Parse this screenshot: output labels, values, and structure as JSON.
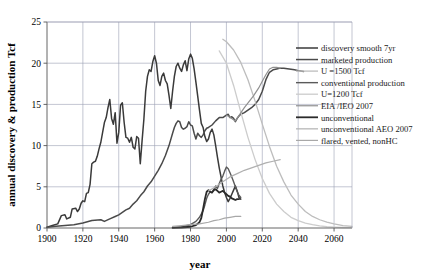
{
  "chart_data": {
    "type": "line",
    "title": "",
    "xlabel": "year",
    "ylabel": "annual discovery & production Tcf",
    "xlim": [
      1900,
      2070
    ],
    "ylim": [
      0,
      25
    ],
    "xticks": [
      1900,
      1920,
      1940,
      1960,
      1980,
      2000,
      2020,
      2040,
      2060
    ],
    "yticks": [
      0,
      5,
      10,
      15,
      20,
      25
    ],
    "grid": true,
    "legend_position": "right",
    "series": [
      {
        "name": "discovery smooth 7yr",
        "color": "#3a3a3a",
        "width": 1.5,
        "points": [
          [
            1900,
            0.1
          ],
          [
            1903,
            0.3
          ],
          [
            1906,
            0.5
          ],
          [
            1908,
            1.5
          ],
          [
            1910,
            1.6
          ],
          [
            1911,
            1.1
          ],
          [
            1913,
            1.3
          ],
          [
            1914,
            2.3
          ],
          [
            1916,
            2.4
          ],
          [
            1917,
            2.0
          ],
          [
            1918,
            2.3
          ],
          [
            1919,
            3.0
          ],
          [
            1920,
            3.3
          ],
          [
            1921,
            3.2
          ],
          [
            1922,
            4.2
          ],
          [
            1923,
            4.3
          ],
          [
            1924,
            5.3
          ],
          [
            1925,
            7.8
          ],
          [
            1926,
            8.0
          ],
          [
            1927,
            8.1
          ],
          [
            1928,
            8.7
          ],
          [
            1929,
            9.6
          ],
          [
            1930,
            10.4
          ],
          [
            1931,
            11.6
          ],
          [
            1932,
            12.8
          ],
          [
            1933,
            13.4
          ],
          [
            1934,
            14.6
          ],
          [
            1935,
            15.6
          ],
          [
            1936,
            13.3
          ],
          [
            1937,
            12.6
          ],
          [
            1938,
            14.0
          ],
          [
            1939,
            10.3
          ],
          [
            1940,
            11.6
          ],
          [
            1941,
            14.9
          ],
          [
            1942,
            15.2
          ],
          [
            1943,
            12.8
          ],
          [
            1944,
            11.0
          ],
          [
            1945,
            10.9
          ],
          [
            1946,
            10.4
          ],
          [
            1947,
            11.0
          ],
          [
            1948,
            9.8
          ],
          [
            1949,
            9.6
          ],
          [
            1950,
            11.1
          ],
          [
            1951,
            10.9
          ],
          [
            1952,
            7.8
          ],
          [
            1953,
            10.6
          ],
          [
            1954,
            13.2
          ],
          [
            1955,
            16.6
          ],
          [
            1956,
            18.4
          ],
          [
            1957,
            19.2
          ],
          [
            1958,
            19.0
          ],
          [
            1959,
            20.2
          ],
          [
            1960,
            20.9
          ],
          [
            1961,
            20.0
          ],
          [
            1962,
            17.9
          ],
          [
            1963,
            17.3
          ],
          [
            1964,
            18.4
          ],
          [
            1965,
            18.8
          ],
          [
            1966,
            17.9
          ],
          [
            1967,
            17.5
          ],
          [
            1968,
            16.1
          ],
          [
            1969,
            14.5
          ],
          [
            1970,
            16.6
          ],
          [
            1971,
            18.4
          ],
          [
            1972,
            19.6
          ],
          [
            1973,
            20.0
          ],
          [
            1974,
            19.4
          ],
          [
            1975,
            19.0
          ],
          [
            1976,
            19.8
          ],
          [
            1977,
            20.3
          ],
          [
            1978,
            19.1
          ],
          [
            1979,
            20.5
          ],
          [
            1980,
            21.1
          ],
          [
            1981,
            20.6
          ],
          [
            1982,
            19.3
          ],
          [
            1983,
            17.7
          ],
          [
            1984,
            16.0
          ],
          [
            1985,
            14.3
          ],
          [
            1986,
            12.7
          ],
          [
            1987,
            12.2
          ],
          [
            1988,
            11.1
          ],
          [
            1989,
            10.5
          ],
          [
            1990,
            10.8
          ],
          [
            1991,
            11.6
          ],
          [
            1992,
            12.0
          ],
          [
            1993,
            11.3
          ],
          [
            1994,
            10.0
          ],
          [
            1995,
            8.6
          ],
          [
            1996,
            7.3
          ],
          [
            1997,
            6.2
          ],
          [
            1998,
            5.1
          ],
          [
            1999,
            4.3
          ],
          [
            2000,
            3.7
          ],
          [
            2001,
            3.2
          ],
          [
            2002,
            3.6
          ],
          [
            2003,
            4.1
          ],
          [
            2004,
            4.6
          ],
          [
            2005,
            5.1
          ],
          [
            2006,
            4.5
          ],
          [
            2007,
            3.7
          ],
          [
            2008,
            3.5
          ]
        ]
      },
      {
        "name": "marketed production",
        "color": "#4a4a4a",
        "width": 1.5,
        "points": [
          [
            1900,
            0.1
          ],
          [
            1905,
            0.2
          ],
          [
            1910,
            0.3
          ],
          [
            1915,
            0.4
          ],
          [
            1920,
            0.6
          ],
          [
            1925,
            0.9
          ],
          [
            1930,
            1.0
          ],
          [
            1932,
            0.8
          ],
          [
            1935,
            1.1
          ],
          [
            1938,
            1.4
          ],
          [
            1940,
            1.6
          ],
          [
            1942,
            1.9
          ],
          [
            1944,
            2.2
          ],
          [
            1946,
            2.4
          ],
          [
            1948,
            2.9
          ],
          [
            1950,
            3.3
          ],
          [
            1952,
            3.9
          ],
          [
            1954,
            4.4
          ],
          [
            1956,
            5.1
          ],
          [
            1958,
            5.6
          ],
          [
            1960,
            6.3
          ],
          [
            1962,
            7.0
          ],
          [
            1964,
            7.8
          ],
          [
            1966,
            8.8
          ],
          [
            1968,
            10.0
          ],
          [
            1970,
            11.5
          ],
          [
            1971,
            12.2
          ],
          [
            1972,
            12.7
          ],
          [
            1973,
            13.0
          ],
          [
            1974,
            12.9
          ],
          [
            1975,
            12.2
          ],
          [
            1976,
            12.0
          ],
          [
            1977,
            12.1
          ],
          [
            1978,
            12.3
          ],
          [
            1979,
            12.9
          ],
          [
            1980,
            12.5
          ],
          [
            1981,
            12.4
          ],
          [
            1982,
            11.5
          ],
          [
            1983,
            10.8
          ],
          [
            1984,
            11.5
          ],
          [
            1985,
            11.2
          ],
          [
            1986,
            11.0
          ],
          [
            1987,
            11.3
          ],
          [
            1988,
            11.8
          ],
          [
            1989,
            12.1
          ],
          [
            1990,
            12.2
          ],
          [
            1992,
            12.5
          ],
          [
            1994,
            13.0
          ],
          [
            1996,
            13.4
          ],
          [
            1998,
            13.4
          ],
          [
            2000,
            13.7
          ],
          [
            2001,
            13.8
          ],
          [
            2002,
            13.4
          ],
          [
            2003,
            13.5
          ],
          [
            2004,
            13.3
          ],
          [
            2005,
            12.9
          ],
          [
            2006,
            13.3
          ],
          [
            2007,
            13.6
          ],
          [
            2008,
            13.8
          ],
          [
            2010,
            14.0
          ],
          [
            2012,
            14.3
          ],
          [
            2014,
            14.6
          ],
          [
            2016,
            15.0
          ],
          [
            2018,
            15.6
          ],
          [
            2020,
            16.6
          ],
          [
            2022,
            18.0
          ],
          [
            2024,
            18.9
          ],
          [
            2026,
            19.2
          ],
          [
            2028,
            19.3
          ],
          [
            2030,
            19.4
          ],
          [
            2032,
            19.4
          ],
          [
            2035,
            19.3
          ],
          [
            2038,
            19.2
          ],
          [
            2040,
            19.1
          ],
          [
            2043,
            19.0
          ]
        ]
      },
      {
        "name": "U =1500 Tcf",
        "color": "#bdbdbd",
        "width": 1.3,
        "points": [
          [
            1998,
            22.9
          ],
          [
            2000,
            22.6
          ],
          [
            2004,
            21.6
          ],
          [
            2008,
            20.1
          ],
          [
            2012,
            18.0
          ],
          [
            2016,
            15.4
          ],
          [
            2020,
            12.6
          ],
          [
            2024,
            9.9
          ],
          [
            2028,
            7.5
          ],
          [
            2032,
            5.6
          ],
          [
            2036,
            4.0
          ],
          [
            2040,
            2.9
          ],
          [
            2044,
            2.0
          ],
          [
            2048,
            1.4
          ],
          [
            2052,
            1.0
          ],
          [
            2056,
            0.7
          ],
          [
            2060,
            0.5
          ],
          [
            2065,
            0.3
          ],
          [
            2070,
            0.2
          ]
        ]
      },
      {
        "name": "conventional production",
        "color": "#5a5a5a",
        "width": 1.4,
        "points": [
          [
            1970,
            0.05
          ],
          [
            1975,
            0.15
          ],
          [
            1980,
            0.4
          ],
          [
            1983,
            0.8
          ],
          [
            1985,
            1.3
          ],
          [
            1987,
            2.1
          ],
          [
            1988,
            2.8
          ],
          [
            1989,
            3.6
          ],
          [
            1990,
            4.1
          ],
          [
            1991,
            4.4
          ],
          [
            1992,
            4.3
          ],
          [
            1993,
            4.7
          ],
          [
            1994,
            5.1
          ],
          [
            1995,
            4.8
          ],
          [
            1996,
            5.4
          ],
          [
            1997,
            5.9
          ],
          [
            1998,
            6.3
          ],
          [
            1999,
            6.9
          ],
          [
            2000,
            7.4
          ],
          [
            2001,
            7.2
          ],
          [
            2002,
            6.7
          ],
          [
            2003,
            6.2
          ],
          [
            2004,
            5.6
          ],
          [
            2005,
            5.0
          ],
          [
            2006,
            4.4
          ],
          [
            2007,
            4.0
          ],
          [
            2008,
            3.7
          ]
        ]
      },
      {
        "name": "U=1200 Tcf",
        "color": "#cccccc",
        "width": 1.3,
        "points": [
          [
            1996,
            21.5
          ],
          [
            2000,
            20.0
          ],
          [
            2004,
            17.3
          ],
          [
            2008,
            14.1
          ],
          [
            2012,
            11.0
          ],
          [
            2016,
            8.3
          ],
          [
            2020,
            6.0
          ],
          [
            2024,
            4.2
          ],
          [
            2028,
            2.9
          ],
          [
            2032,
            2.0
          ],
          [
            2036,
            1.3
          ],
          [
            2040,
            0.9
          ],
          [
            2044,
            0.6
          ],
          [
            2048,
            0.4
          ],
          [
            2052,
            0.25
          ],
          [
            2056,
            0.15
          ],
          [
            2060,
            0.1
          ],
          [
            2065,
            0.06
          ],
          [
            2070,
            0.04
          ]
        ]
      },
      {
        "name": "EIA /IEO 2007",
        "color": "#909090",
        "width": 1.2,
        "points": [
          [
            2000,
            13.7
          ],
          [
            2005,
            13.0
          ],
          [
            2010,
            14.6
          ],
          [
            2015,
            16.0
          ],
          [
            2018,
            17.0
          ],
          [
            2020,
            17.8
          ],
          [
            2022,
            18.6
          ],
          [
            2024,
            19.3
          ],
          [
            2026,
            19.5
          ],
          [
            2028,
            19.5
          ],
          [
            2030,
            19.4
          ]
        ]
      },
      {
        "name": "unconventional",
        "color": "#2b2b2b",
        "width": 1.8,
        "points": [
          [
            1970,
            0.02
          ],
          [
            1975,
            0.06
          ],
          [
            1980,
            0.15
          ],
          [
            1983,
            0.35
          ],
          [
            1985,
            0.7
          ],
          [
            1986,
            1.2
          ],
          [
            1987,
            2.3
          ],
          [
            1988,
            3.5
          ],
          [
            1989,
            4.4
          ],
          [
            1990,
            4.6
          ],
          [
            1991,
            4.4
          ],
          [
            1992,
            4.3
          ],
          [
            1993,
            4.6
          ],
          [
            1994,
            4.7
          ],
          [
            1995,
            4.5
          ],
          [
            1996,
            4.3
          ],
          [
            1997,
            4.4
          ],
          [
            1998,
            4.5
          ],
          [
            1999,
            4.3
          ],
          [
            2000,
            4.1
          ],
          [
            2001,
            3.9
          ],
          [
            2002,
            3.8
          ],
          [
            2003,
            3.6
          ],
          [
            2004,
            3.5
          ],
          [
            2005,
            3.4
          ],
          [
            2006,
            3.5
          ],
          [
            2007,
            3.5
          ]
        ]
      },
      {
        "name": "unconventional AEO 2007",
        "color": "#b0b0b0",
        "width": 1.2,
        "points": [
          [
            1990,
            4.5
          ],
          [
            1994,
            5.0
          ],
          [
            1998,
            5.6
          ],
          [
            2002,
            6.2
          ],
          [
            2006,
            6.6
          ],
          [
            2010,
            7.0
          ],
          [
            2014,
            7.3
          ],
          [
            2018,
            7.6
          ],
          [
            2022,
            7.9
          ],
          [
            2026,
            8.1
          ],
          [
            2030,
            8.3
          ]
        ]
      },
      {
        "name": "flared, vented,  nonHC",
        "color": "#a8a8a8",
        "width": 1.2,
        "points": [
          [
            1970,
            0.2
          ],
          [
            1975,
            0.3
          ],
          [
            1980,
            0.4
          ],
          [
            1985,
            0.5
          ],
          [
            1990,
            0.7
          ],
          [
            1993,
            0.9
          ],
          [
            1996,
            1.0
          ],
          [
            1999,
            1.2
          ],
          [
            2002,
            1.3
          ],
          [
            2005,
            1.4
          ],
          [
            2008,
            1.4
          ]
        ]
      }
    ]
  }
}
